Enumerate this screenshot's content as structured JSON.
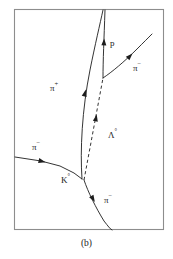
{
  "figure": {
    "caption": "(b)",
    "type": "bubble-chamber-event-diagram",
    "frame": {
      "x": 14,
      "y": 9,
      "width": 150,
      "height": 221,
      "stroke_color": "#8d8d8d"
    },
    "track_color": "#1d1d1d",
    "background_color": "#ffffff"
  },
  "labels": {
    "pi_plus": {
      "particle": "π",
      "charge": "+",
      "x": 50,
      "y": 84
    },
    "pi_minus_incoming": {
      "particle": "π",
      "charge": "−",
      "x": 32,
      "y": 143
    },
    "pi_minus_upper_right": {
      "particle": "π",
      "charge": "−",
      "x": 133,
      "y": 64
    },
    "pi_minus_lower": {
      "particle": "π",
      "charge": "−",
      "x": 104,
      "y": 196
    },
    "proton": {
      "particle": "p",
      "charge": "",
      "x": 110,
      "y": 39
    },
    "lambda_zero": {
      "particle": "Λ",
      "charge": "°",
      "x": 108,
      "y": 131
    },
    "k_zero": {
      "particle": "K",
      "charge": "°",
      "x": 61,
      "y": 176
    }
  },
  "tracks": [
    {
      "name": "pi-minus-incoming-track",
      "style": "solid",
      "path": "M 15,157 L 41,161 L 60,166 L 74,173 L 82,179",
      "arrow": {
        "x": 42,
        "y": 161.3,
        "angle": 14
      }
    },
    {
      "name": "pi-plus-track",
      "style": "solid",
      "path": "M 82,179 C 80,150 82,110 90,70 C 95,45 100,24 103,10",
      "arrow": {
        "x": 85,
        "y": 93,
        "angle": -76
      }
    },
    {
      "name": "lambda-zero-track",
      "style": "dashed",
      "path": "M 84,180 L 103,78",
      "arrow": {
        "x": 96,
        "y": 118,
        "angle": -79
      }
    },
    {
      "name": "proton-track",
      "style": "solid",
      "path": "M 103,78 C 103,60 104,40 105,10",
      "arrow": {
        "x": 104,
        "y": 42,
        "angle": -87
      }
    },
    {
      "name": "pi-minus-upper-right-track",
      "style": "solid",
      "path": "M 103,78 C 112,72 124,62 137,49 C 143,43 148,38 152,34",
      "arrow": {
        "x": 130,
        "y": 56,
        "angle": -45
      }
    },
    {
      "name": "pi-minus-lower-track",
      "style": "solid",
      "path": "M 84,180 C 88,192 96,208 104,221 C 108,226 110,229 112,230",
      "arrow": {
        "x": 93,
        "y": 199,
        "angle": 60
      }
    }
  ]
}
